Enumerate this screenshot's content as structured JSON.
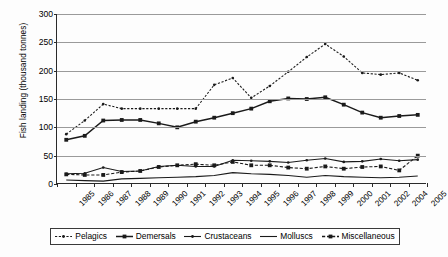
{
  "chart_data": {
    "type": "line",
    "title": "",
    "xlabel": "",
    "ylabel": "Fish landing (thousand tonnes)",
    "ylim": [
      0,
      300
    ],
    "ytick_values": [
      0,
      50,
      100,
      150,
      200,
      250,
      300
    ],
    "ytick_labels": [
      "0",
      "50",
      "100",
      "150",
      "200",
      "250",
      "300"
    ],
    "grid": true,
    "legend_position": "bottom",
    "categories": [
      "1985",
      "1986",
      "1987",
      "1988",
      "1989",
      "1990",
      "1991",
      "1992",
      "1993",
      "1994",
      "1995",
      "1996",
      "1997",
      "1998",
      "1999",
      "2000",
      "2001",
      "2002",
      "2004",
      "2005"
    ],
    "series": [
      {
        "name": "Pelagics",
        "marker": "small-dot",
        "line": "dotted",
        "values": [
          88,
          112,
          141,
          133,
          133,
          133,
          133,
          133,
          175,
          187,
          152,
          173,
          198,
          224,
          247,
          225,
          196,
          193,
          196,
          183
        ]
      },
      {
        "name": "Demersals",
        "marker": "square",
        "line": "solid",
        "values": [
          78,
          85,
          112,
          113,
          113,
          107,
          100,
          110,
          117,
          125,
          133,
          146,
          151,
          150,
          153,
          140,
          126,
          117,
          120,
          122
        ]
      },
      {
        "name": "Crustaceans",
        "marker": "small-dot",
        "line": "solid",
        "values": [
          18,
          19,
          29,
          22,
          23,
          31,
          33,
          31,
          31,
          42,
          41,
          40,
          38,
          42,
          45,
          39,
          40,
          44,
          41,
          43
        ]
      },
      {
        "name": "Molluscs",
        "marker": "none",
        "line": "solid",
        "values": [
          7,
          6,
          5,
          9,
          10,
          11,
          12,
          13,
          15,
          20,
          18,
          17,
          15,
          12,
          15,
          13,
          12,
          11,
          12,
          14
        ]
      },
      {
        "name": "Miscellaneous",
        "marker": "square",
        "line": "dashed",
        "values": [
          17,
          16,
          16,
          21,
          23,
          30,
          33,
          35,
          33,
          39,
          33,
          33,
          29,
          27,
          31,
          27,
          30,
          31,
          24,
          50
        ]
      }
    ]
  },
  "legend": {
    "items": [
      {
        "label": "Pelagics"
      },
      {
        "label": "Demersals"
      },
      {
        "label": "Crustaceans"
      },
      {
        "label": "Molluscs"
      },
      {
        "label": "Miscellaneous"
      }
    ]
  }
}
